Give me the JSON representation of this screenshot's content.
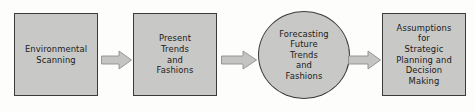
{
  "diagram": {
    "type": "linear-process-flow",
    "background_color": "#fdfdfc",
    "node_fill_color": "#c8c8c6",
    "node_border_color": "#3b3b3b",
    "shadow_color": "#a0a09e",
    "arrow_fill_color": "#c4c4c2",
    "arrow_border_color": "#8e8e8c",
    "text_color": "#1a1a1a",
    "nodes": [
      {
        "id": "environmental-scanning",
        "shape": "rectangle",
        "label": "Environmental\nScanning",
        "x": 14,
        "y": 13,
        "width": 84,
        "height": 83
      },
      {
        "id": "present-trends-and-fashions",
        "shape": "rectangle",
        "label": "Present\nTrends\nand\nFashions",
        "x": 133,
        "y": 13,
        "width": 84,
        "height": 83
      },
      {
        "id": "forecasting-future-trends-and-fashions",
        "shape": "oval",
        "label": "Forecasting\nFuture\nTrends\nand\nFashions",
        "x": 258,
        "y": 11,
        "width": 92,
        "height": 88
      },
      {
        "id": "assumptions-for-strategic-planning-and-decision-making",
        "shape": "rectangle",
        "label": "Assumptions\nfor\nStrategic\nPlanning and\nDecision\nMaking",
        "x": 382,
        "y": 13,
        "width": 84,
        "height": 83
      }
    ],
    "connectors": [
      {
        "id": "arrow-1",
        "from": "environmental-scanning",
        "to": "present-trends-and-fashions",
        "x": 101,
        "width": 31
      },
      {
        "id": "arrow-2",
        "from": "present-trends-and-fashions",
        "to": "forecasting-future-trends-and-fashions",
        "x": 221,
        "width": 36
      },
      {
        "id": "arrow-3",
        "from": "forecasting-future-trends-and-fashions",
        "to": "assumptions-for-strategic-planning-and-decision-making",
        "x": 348,
        "width": 33
      }
    ]
  }
}
